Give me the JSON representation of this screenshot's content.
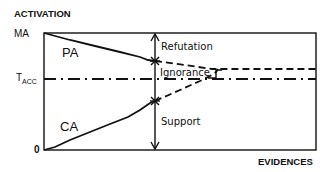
{
  "diagram": {
    "y_axis_label": "ACTIVATION",
    "x_axis_label": "EVIDENCES",
    "y_ticks": {
      "max": "MA",
      "threshold_main": "T",
      "threshold_sub": "ACC",
      "zero": "0"
    },
    "curves": {
      "upper": "PA",
      "lower": "CA"
    },
    "regions": {
      "top": "Refutation",
      "middle": "Ignorance",
      "bottom": "Support"
    },
    "colors": {
      "ink": "#111111",
      "background": "#ffffff"
    }
  }
}
